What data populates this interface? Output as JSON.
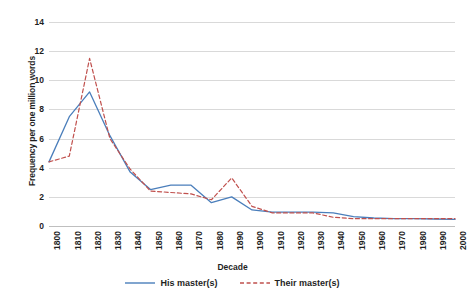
{
  "chart_data": {
    "type": "line",
    "title": "",
    "xlabel": "Decade",
    "ylabel": "Frequency per one million words",
    "categories": [
      "1800",
      "1810",
      "1820",
      "1830",
      "1840",
      "1850",
      "1860",
      "1870",
      "1880",
      "1890",
      "1900",
      "1910",
      "1920",
      "1930",
      "1940",
      "1950",
      "1960",
      "1970",
      "1980",
      "1990",
      "2000"
    ],
    "ylim": [
      0,
      14
    ],
    "ytick_values": [
      0,
      2,
      4,
      6,
      8,
      10,
      12,
      14
    ],
    "ytick_labels": [
      "0",
      "2",
      "4",
      "6",
      "8",
      "10",
      "12",
      "14"
    ],
    "grid": true,
    "legend_position": "bottom",
    "series": [
      {
        "name": "His master(s)",
        "color": "#4a7ebb",
        "style": "solid",
        "values": [
          4.4,
          7.5,
          9.2,
          6.2,
          3.7,
          2.5,
          2.8,
          2.8,
          1.6,
          2.0,
          1.1,
          0.95,
          0.95,
          0.95,
          0.9,
          0.65,
          0.55,
          0.5,
          0.5,
          0.48,
          0.45
        ]
      },
      {
        "name": "Their master(s)",
        "color": "#c0504d",
        "style": "dashed",
        "values": [
          4.4,
          4.8,
          11.5,
          6.0,
          3.9,
          2.4,
          2.3,
          2.2,
          1.8,
          3.3,
          1.35,
          0.9,
          0.9,
          0.9,
          0.6,
          0.5,
          0.5,
          0.5,
          0.5,
          0.5,
          0.5
        ]
      }
    ]
  },
  "axis": {
    "x_title": "Decade",
    "y_title": "Frequency per one million words"
  },
  "legend": {
    "items": [
      {
        "label": "His master(s)",
        "color": "#4a7ebb",
        "style": "solid"
      },
      {
        "label": "Their master(s)",
        "color": "#c0504d",
        "style": "dashed"
      }
    ]
  }
}
